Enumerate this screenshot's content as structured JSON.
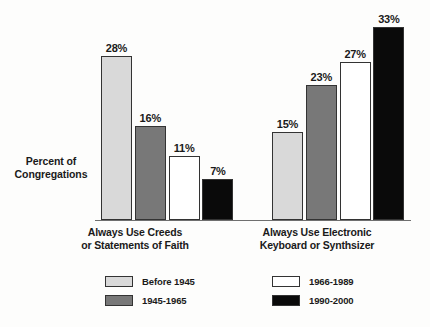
{
  "chart_data": {
    "type": "bar",
    "title": "",
    "subtitle": "",
    "xlabel": "",
    "ylabel": "Percent of Congregations",
    "ylim": [
      0,
      35
    ],
    "grid": false,
    "legend_position": "bottom",
    "value_suffix": "%",
    "categories": [
      "Always Use Creeds or Statements of Faith",
      "Always Use Electronic Keyboard or Synthsizer"
    ],
    "series": [
      {
        "name": "Before 1945",
        "color": "#d9d9d9",
        "values": [
          28,
          15
        ]
      },
      {
        "name": "1945-1965",
        "color": "#787878",
        "values": [
          16,
          23
        ]
      },
      {
        "name": "1966-1989",
        "color": "#ffffff",
        "values": [
          11,
          27
        ]
      },
      {
        "name": "1990-2000",
        "color": "#0a0a0a",
        "values": [
          7,
          33
        ]
      }
    ]
  },
  "axis": {
    "y_label_line1": "Percent of",
    "y_label_line2": "Congregations"
  },
  "categories": [
    {
      "line1": "Always Use Creeds",
      "line2": "or Statements of Faith"
    },
    {
      "line1": "Always Use Electronic",
      "line2": "Keyboard or Synthsizer"
    }
  ],
  "bars": [
    {
      "value_label": "28%",
      "series": "Before 1945",
      "category": "Always Use Creeds or Statements of Faith"
    },
    {
      "value_label": "16%",
      "series": "1945-1965",
      "category": "Always Use Creeds or Statements of Faith"
    },
    {
      "value_label": "11%",
      "series": "1966-1989",
      "category": "Always Use Creeds or Statements of Faith"
    },
    {
      "value_label": "7%",
      "series": "1990-2000",
      "category": "Always Use Creeds or Statements of Faith"
    },
    {
      "value_label": "15%",
      "series": "Before 1945",
      "category": "Always Use Electronic Keyboard or Synthsizer"
    },
    {
      "value_label": "23%",
      "series": "1945-1965",
      "category": "Always Use Electronic Keyboard or Synthsizer"
    },
    {
      "value_label": "27%",
      "series": "1966-1989",
      "category": "Always Use Electronic Keyboard or Synthsizer"
    },
    {
      "value_label": "33%",
      "series": "1990-2000",
      "category": "Always Use Electronic Keyboard or Synthsizer"
    }
  ],
  "legend": {
    "items": [
      {
        "label": "Before 1945",
        "color": "#d9d9d9"
      },
      {
        "label": "1945-1965",
        "color": "#787878"
      },
      {
        "label": "1966-1989",
        "color": "#ffffff"
      },
      {
        "label": "1990-2000",
        "color": "#0a0a0a"
      }
    ]
  }
}
